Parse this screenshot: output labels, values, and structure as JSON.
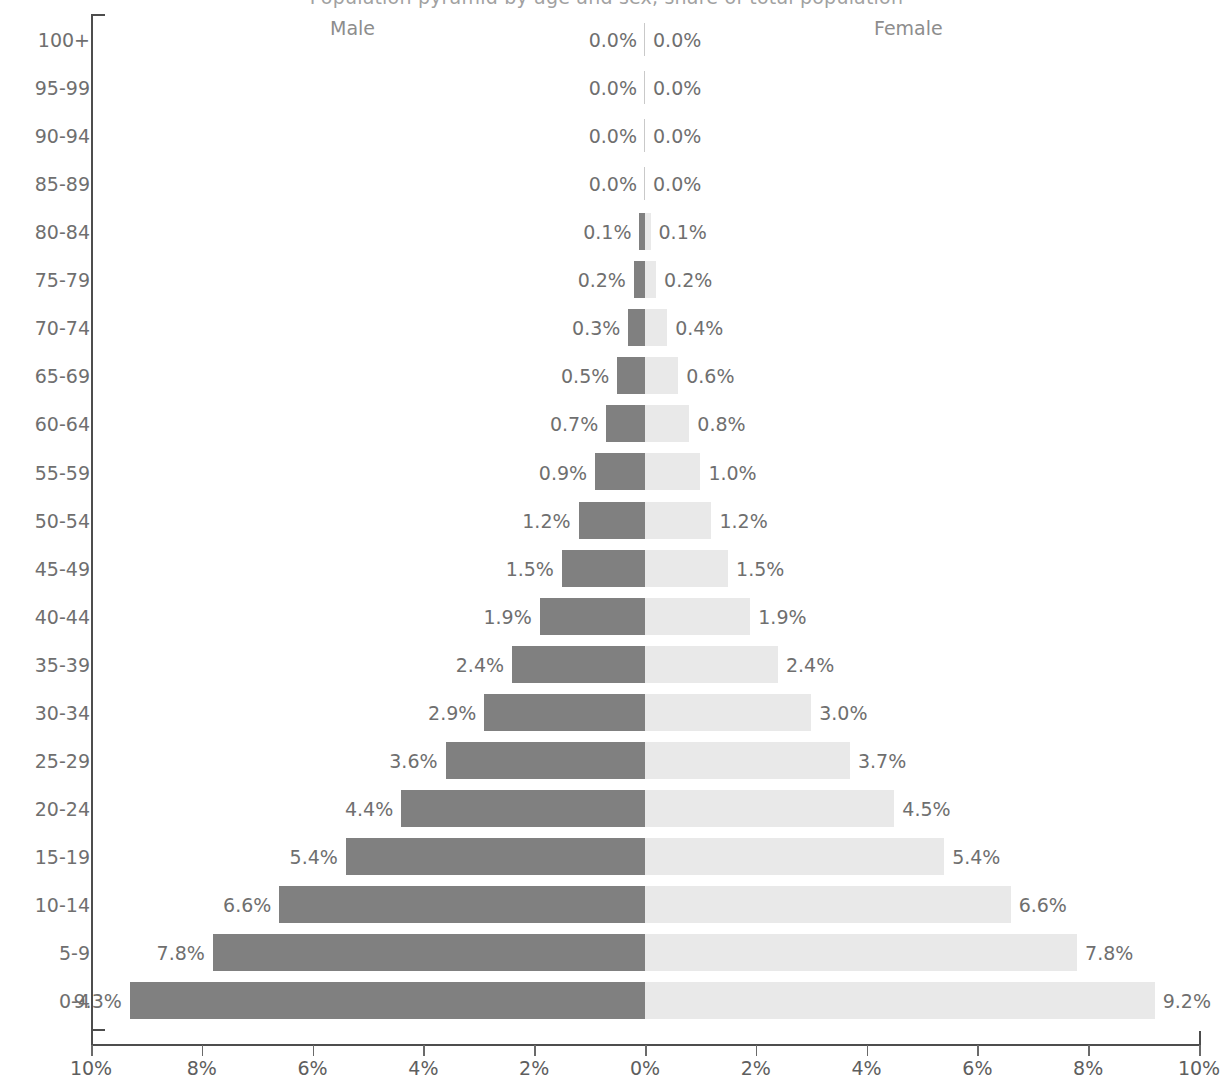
{
  "chart_data": {
    "type": "bar",
    "subtype": "population-pyramid",
    "title": "Population pyramid by age and sex, share of total population",
    "xlabel": "",
    "ylabel": "",
    "xlim": [
      -10,
      10
    ],
    "x_tick_labels": [
      "10%",
      "8%",
      "6%",
      "4%",
      "2%",
      "0%",
      "2%",
      "4%",
      "6%",
      "8%",
      "10%"
    ],
    "x_tick_values": [
      -10,
      -8,
      -6,
      -4,
      -2,
      0,
      2,
      4,
      6,
      8,
      10
    ],
    "grid": false,
    "legend_position": "top",
    "categories": [
      "100+",
      "95-99",
      "90-94",
      "85-89",
      "80-84",
      "75-79",
      "70-74",
      "65-69",
      "60-64",
      "55-59",
      "50-54",
      "45-49",
      "40-44",
      "35-39",
      "30-34",
      "25-29",
      "20-24",
      "15-19",
      "10-14",
      "5-9",
      "0-4"
    ],
    "series": [
      {
        "name": "Male",
        "color": "#808080",
        "side": "left",
        "values": [
          0.0,
          0.0,
          0.0,
          0.0,
          0.1,
          0.2,
          0.3,
          0.5,
          0.7,
          0.9,
          1.2,
          1.5,
          1.9,
          2.4,
          2.9,
          3.6,
          4.4,
          5.4,
          6.6,
          7.8,
          9.3
        ],
        "labels": [
          "0.0%",
          "0.0%",
          "0.0%",
          "0.0%",
          "0.1%",
          "0.2%",
          "0.3%",
          "0.5%",
          "0.7%",
          "0.9%",
          "1.2%",
          "1.5%",
          "1.9%",
          "2.4%",
          "2.9%",
          "3.6%",
          "4.4%",
          "5.4%",
          "6.6%",
          "7.8%",
          "9.3%"
        ]
      },
      {
        "name": "Female",
        "color": "#e9e9e9",
        "side": "right",
        "values": [
          0.0,
          0.0,
          0.0,
          0.0,
          0.1,
          0.2,
          0.4,
          0.6,
          0.8,
          1.0,
          1.2,
          1.5,
          1.9,
          2.4,
          3.0,
          3.7,
          4.5,
          5.4,
          6.6,
          7.8,
          9.2
        ],
        "labels": [
          "0.0%",
          "0.0%",
          "0.0%",
          "0.0%",
          "0.1%",
          "0.2%",
          "0.4%",
          "0.6%",
          "0.8%",
          "1.0%",
          "1.2%",
          "1.5%",
          "1.9%",
          "2.4%",
          "3.0%",
          "3.7%",
          "4.5%",
          "5.4%",
          "6.6%",
          "7.8%",
          "9.2%"
        ]
      }
    ]
  },
  "header": {
    "male_label": "Male",
    "female_label": "Female"
  },
  "colors": {
    "male_bar": "#808080",
    "female_bar": "#e9e9e9",
    "axis": "#4d4d4d",
    "text": "#6f6f6f",
    "background": "#ffffff"
  }
}
